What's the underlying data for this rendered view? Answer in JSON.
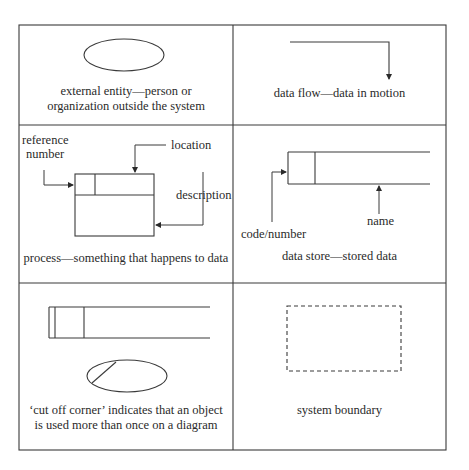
{
  "cells": [
    {
      "id": "external-entity",
      "caption_lines": [
        "external entity—person or",
        "organization outside the system"
      ]
    },
    {
      "id": "data-flow",
      "caption_lines": [
        "data flow—data in motion"
      ]
    },
    {
      "id": "process",
      "caption_lines": [
        "process—something that happens to data"
      ],
      "labels": {
        "reference_number_line1": "reference",
        "reference_number_line2": "number",
        "location": "location",
        "description": "description"
      }
    },
    {
      "id": "data-store",
      "caption_lines": [
        "data store—stored data"
      ],
      "labels": {
        "code_number": "code/number",
        "name": "name"
      }
    },
    {
      "id": "cut-off-corner",
      "caption_lines": [
        "‘cut off corner’ indicates that an object",
        "is used more than once on a diagram"
      ]
    },
    {
      "id": "system-boundary",
      "caption_lines": [
        "system boundary"
      ]
    }
  ],
  "colors": {
    "line": "#3a3a3a",
    "text": "#2a2a2a",
    "background": "#ffffff"
  }
}
